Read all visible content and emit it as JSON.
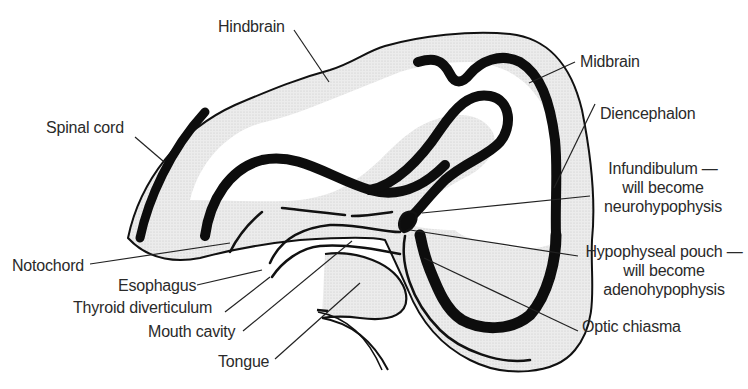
{
  "diagram": {
    "colors": {
      "background": "#ffffff",
      "outline": "#111111",
      "fill_stipple": "#e4e4e4",
      "neural_wall": "#0d0d0d",
      "label_text": "#2a2a2a"
    },
    "labels": {
      "hindbrain": "Hindbrain",
      "midbrain": "Midbrain",
      "spinal_cord": "Spinal cord",
      "diencephalon": "Diencephalon",
      "infundibulum_1": "Infundibulum —",
      "infundibulum_2": "will become",
      "infundibulum_3": "neurohypophysis",
      "hypophyseal_1": "Hypophyseal pouch —",
      "hypophyseal_2": "will become",
      "hypophyseal_3": "adenohypophysis",
      "optic_chiasma": "Optic chiasma",
      "notochord": "Notochord",
      "esophagus": "Esophagus",
      "thyroid": "Thyroid diverticulum",
      "mouth_cavity": "Mouth cavity",
      "tongue": "Tongue"
    }
  }
}
